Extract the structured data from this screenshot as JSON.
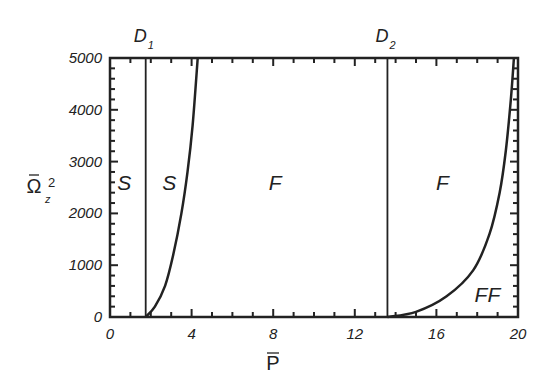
{
  "chart_data": {
    "type": "line",
    "title": "",
    "xlabel": "P̄",
    "ylabel": "Ω̄z²",
    "xlim": [
      0,
      20
    ],
    "ylim": [
      0,
      5000
    ],
    "x_ticks": [
      "0",
      "4",
      "8",
      "12",
      "16",
      "20"
    ],
    "y_ticks": [
      "0",
      "1000",
      "2000",
      "3000",
      "4000",
      "5000"
    ],
    "grid": false,
    "legend": null,
    "vertical_lines": [
      {
        "name": "D1",
        "label": "D",
        "subscript": "1",
        "x": 1.75
      },
      {
        "name": "D2",
        "label": "D",
        "subscript": "2",
        "x": 13.6
      }
    ],
    "series": [
      {
        "name": "S/F boundary",
        "x": [
          1.75,
          2.2,
          2.7,
          3.1,
          3.5,
          3.8,
          4.05,
          4.3
        ],
        "y": [
          0,
          200,
          600,
          1200,
          2000,
          2800,
          3700,
          5000
        ]
      },
      {
        "name": "F/FF boundary",
        "x": [
          13.6,
          15.0,
          16.5,
          17.8,
          18.6,
          19.1,
          19.4,
          19.65,
          19.8
        ],
        "y": [
          0,
          100,
          400,
          900,
          1600,
          2400,
          3200,
          4200,
          5000
        ]
      }
    ],
    "annotations": [
      {
        "text": "S",
        "x": 0.7,
        "y": 2600
      },
      {
        "text": "S",
        "x": 2.9,
        "y": 2600
      },
      {
        "text": "F",
        "x": 8.1,
        "y": 2600
      },
      {
        "text": "F",
        "x": 16.3,
        "y": 2600
      },
      {
        "text": "FF",
        "x": 18.5,
        "y": 450
      }
    ]
  }
}
